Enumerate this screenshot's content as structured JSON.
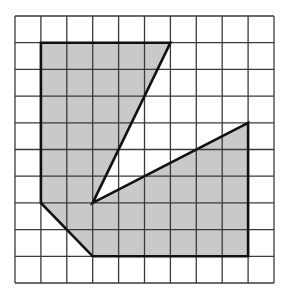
{
  "figure": {
    "grid": {
      "cols": 10,
      "rows": 10,
      "origin_px": [
        15,
        16
      ],
      "cell_w_px": 25.9,
      "cell_h_px": 26.7,
      "line_color": "#3a3a3a"
    },
    "shape": {
      "vertices_grid": [
        [
          1,
          1
        ],
        [
          6,
          1
        ],
        [
          3,
          7
        ],
        [
          9,
          4
        ],
        [
          9,
          9
        ],
        [
          3,
          9
        ],
        [
          1,
          7
        ]
      ],
      "fill_color": "#c9c9c9",
      "stroke_color": "#111111"
    }
  }
}
